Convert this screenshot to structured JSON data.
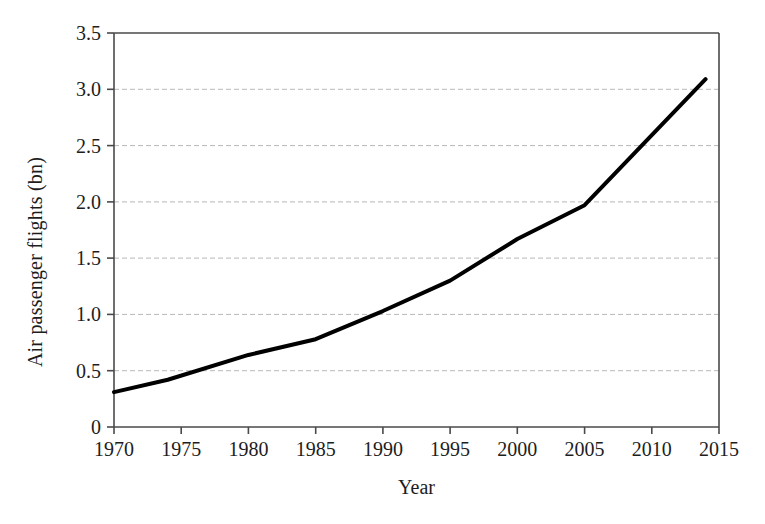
{
  "chart_data": {
    "type": "line",
    "title": "",
    "xlabel": "Year",
    "ylabel": "Air passenger flights (bn)",
    "xlim": [
      1970,
      2015
    ],
    "ylim": [
      0,
      3.5
    ],
    "xticks": [
      1970,
      1975,
      1980,
      1985,
      1990,
      1995,
      2000,
      2005,
      2010,
      2015
    ],
    "xtick_labels": [
      "1970",
      "1975",
      "1980",
      "1985",
      "1990",
      "1995",
      "2000",
      "2005",
      "2010",
      "2015"
    ],
    "yticks": [
      0,
      0.5,
      1.0,
      1.5,
      2.0,
      2.5,
      3.0,
      3.5
    ],
    "ytick_labels": [
      "0",
      "0.5",
      "1.0",
      "1.5",
      "2.0",
      "2.5",
      "3.0",
      "3.5"
    ],
    "grid": "horizontal-dashed",
    "gridlines_at": [
      0.5,
      1.0,
      1.5,
      2.0,
      2.5,
      3.0
    ],
    "legend": null,
    "series": [
      {
        "name": "Air passenger flights",
        "color": "#000000",
        "line_width": 4,
        "x": [
          1970,
          1974,
          1980,
          1985,
          1990,
          1995,
          2000,
          2005,
          2014
        ],
        "values": [
          0.31,
          0.42,
          0.64,
          0.78,
          1.03,
          1.3,
          1.67,
          1.97,
          3.09
        ]
      }
    ],
    "colors": {
      "line": "#000000",
      "axis": "#4a4a4a",
      "grid": "#b9b9b9",
      "text": "#1d1d1d",
      "background": "#ffffff"
    }
  }
}
